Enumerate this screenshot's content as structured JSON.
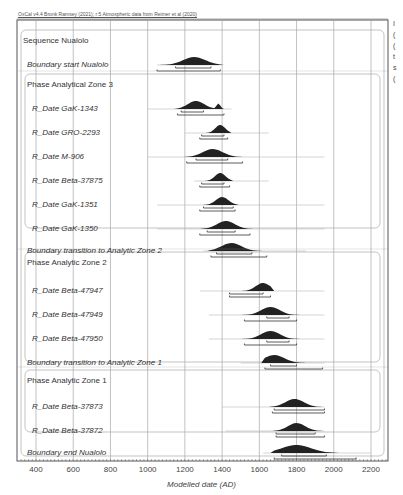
{
  "header": {
    "credit": "OxCal v4.4 Bronk Ramsey (2021); r:5 Atmospheric data from Reimer et al (2020)",
    "right_margin_text": [
      "I",
      "(",
      "(",
      "t",
      "s",
      "("
    ]
  },
  "chart_data": {
    "type": "oxcal-multiplot",
    "title": "",
    "xlabel": "Modelled date (AD)",
    "ylabel": "",
    "xlim": [
      300,
      2300
    ],
    "x_ticks": [
      400,
      600,
      800,
      1000,
      1200,
      1400,
      1600,
      1800,
      2000,
      2200
    ],
    "grid": true,
    "groups": [
      {
        "label": "Sequence Nualolo",
        "kind": "sequence"
      },
      {
        "label": "Phase Analytical Zone 3",
        "kind": "phase"
      },
      {
        "label": "Phase Analytic Zone 2",
        "kind": "phase"
      },
      {
        "label": "Phase Analytic Zone 1",
        "kind": "phase"
      }
    ],
    "rows": [
      {
        "label": "Boundary start Nualolo",
        "type": "boundary",
        "prior_range": [
          1050,
          1400
        ],
        "posterior_peak": 1250,
        "range_68": [
          1150,
          1340
        ],
        "range_95": [
          1050,
          1390
        ]
      },
      {
        "label": "R_Date GaK-1343",
        "type": "rdate",
        "prior_range": [
          1000,
          1450
        ],
        "posterior_peak": 1260,
        "range_68": [
          1180,
          1300
        ],
        "range_95": [
          1160,
          1410
        ],
        "secondary_peak": 1380
      },
      {
        "label": "R_Date GRO-2293",
        "type": "rdate",
        "prior_range": [
          1200,
          1650
        ],
        "posterior_peak": 1390,
        "range_68": [
          1290,
          1410
        ],
        "range_95": [
          1280,
          1430
        ]
      },
      {
        "label": "R_Date M-906",
        "type": "rdate",
        "prior_range": [
          1000,
          1950
        ],
        "posterior_peak": 1350,
        "range_68": [
          1260,
          1430
        ],
        "range_95": [
          1210,
          1510
        ]
      },
      {
        "label": "R_Date Beta-37875",
        "type": "rdate",
        "prior_range": [
          1250,
          1650
        ],
        "posterior_peak": 1390,
        "range_68": [
          1290,
          1410
        ],
        "range_95": [
          1280,
          1440
        ]
      },
      {
        "label": "R_Date GaK-1351",
        "type": "rdate",
        "prior_range": [
          1050,
          1950
        ],
        "posterior_peak": 1400,
        "range_68": [
          1300,
          1460
        ],
        "range_95": [
          1280,
          1470
        ]
      },
      {
        "label": "R_Date GaK-1350",
        "type": "rdate",
        "prior_range": [
          1050,
          1950
        ],
        "posterior_peak": 1420,
        "range_68": [
          1320,
          1470
        ],
        "range_95": [
          1280,
          1550
        ]
      },
      {
        "label": "Boundary transition to Analytic Zone 2",
        "type": "boundary",
        "prior_range": [
          1300,
          1850
        ],
        "posterior_peak": 1450,
        "range_68": [
          1370,
          1560
        ],
        "range_95": [
          1340,
          1640
        ]
      },
      {
        "label": "R_Date Beta-47947",
        "type": "rdate",
        "prior_range": [
          1280,
          1950
        ],
        "posterior_peak": 1620,
        "range_68": [
          1440,
          1620
        ],
        "range_95": [
          1440,
          1660
        ]
      },
      {
        "label": "R_Date Beta-47949",
        "type": "rdate",
        "prior_range": [
          1330,
          1950
        ],
        "posterior_peak": 1660,
        "range_68": [
          1640,
          1760
        ],
        "range_95": [
          1520,
          1800
        ]
      },
      {
        "label": "R_Date Beta-47950",
        "type": "rdate",
        "prior_range": [
          1330,
          1950
        ],
        "posterior_peak": 1660,
        "range_68": [
          1640,
          1760
        ],
        "range_95": [
          1520,
          1800
        ]
      },
      {
        "label": "Boundary transition to Analytic Zone 1",
        "type": "boundary",
        "prior_range": [
          1500,
          1950
        ],
        "posterior_peak": 1680,
        "range_68": [
          1660,
          1800
        ],
        "range_95": [
          1630,
          1940
        ]
      },
      {
        "label": "R_Date Beta-37873",
        "type": "rdate",
        "prior_range": [
          1400,
          1950
        ],
        "posterior_peak": 1790,
        "range_68": [
          1680,
          1950
        ],
        "range_95": [
          1670,
          1950
        ]
      },
      {
        "label": "R_Date Beta-37872",
        "type": "rdate",
        "prior_range": [
          1420,
          1950
        ],
        "posterior_peak": 1800,
        "range_68": [
          1690,
          1900
        ],
        "range_95": [
          1690,
          1950
        ]
      },
      {
        "label": "Boundary end Nualolo",
        "type": "boundary",
        "prior_range": [
          1620,
          2200
        ],
        "posterior_peak": 1800,
        "range_68": [
          1720,
          1960
        ],
        "range_95": [
          1680,
          2120
        ]
      }
    ]
  }
}
